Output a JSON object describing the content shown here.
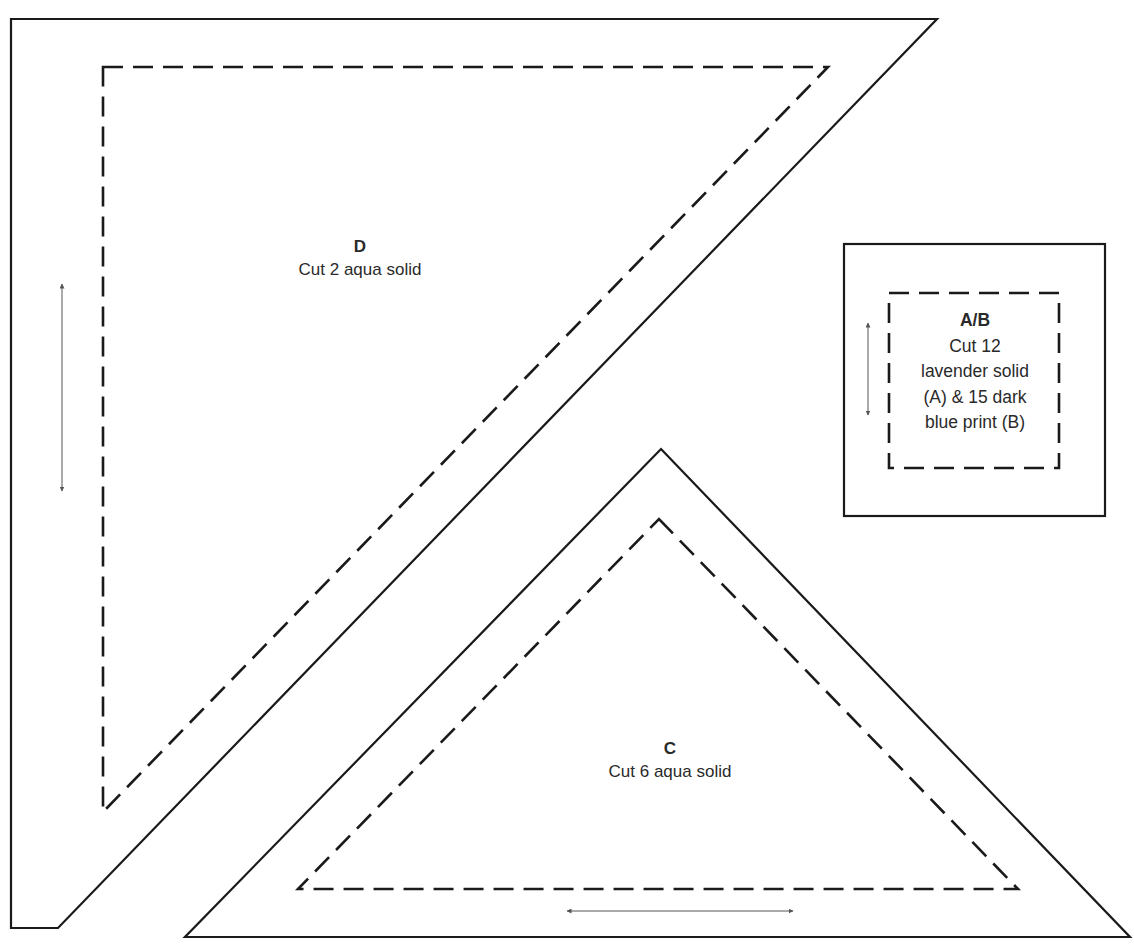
{
  "pieces": {
    "D": {
      "title": "D",
      "instruction": "Cut 2 aqua solid",
      "grain_arrow": "vertical"
    },
    "C": {
      "title": "C",
      "instruction": "Cut 6 aqua solid",
      "grain_arrow": "horizontal"
    },
    "AB": {
      "title": "A/B",
      "lines": [
        "Cut 12",
        "lavender solid",
        "(A) & 15 dark",
        "blue print (B)"
      ],
      "grain_arrow": "vertical"
    }
  },
  "colors": {
    "cut_line": "#1a1a1a",
    "seam_line": "#1a1a1a",
    "grain_arrow": "#555555",
    "background": "#ffffff"
  }
}
